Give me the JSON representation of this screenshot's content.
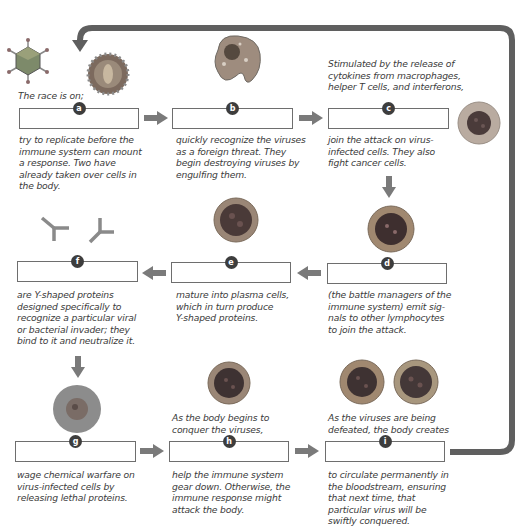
{
  "diagram": {
    "type": "immune-response-flow",
    "colors": {
      "arrow": "#7a7a7a",
      "loop": "#5f5f5f",
      "box_border": "#6e6e6e",
      "badge": "#3d3d3d"
    },
    "steps": [
      {
        "id": "a",
        "badge": "a",
        "text_above": "The race is on;",
        "text_below": "try to replicate before the immune system can mount a response. Two have already taken over cells in the body.",
        "image": "virus-particles"
      },
      {
        "id": "b",
        "badge": "b",
        "text_above": "",
        "text_below": "quickly recognize the viruses as a foreign threat. They begin destroying viruses by engulfing them.",
        "image": "macrophage"
      },
      {
        "id": "c",
        "badge": "c",
        "text_above": "Stimulated by the release of cytokines from macrophages, helper T cells, and interferons,",
        "text_below": "join the attack on virus-infected cells. They also fight cancer cells.",
        "image": "natural-killer-cell"
      },
      {
        "id": "d",
        "badge": "d",
        "text_above": "",
        "text_below": "(the battle managers of the immune system) emit signals to other lymphocytes to join the attack.",
        "image": "helper-t-cell"
      },
      {
        "id": "e",
        "badge": "e",
        "text_above": "",
        "text_below": "mature into plasma cells, which in turn produce Y-shaped proteins.",
        "image": "b-cell"
      },
      {
        "id": "f",
        "badge": "f",
        "text_above": "",
        "text_below": "are Y-shaped proteins designed specifically to recognize a particular viral or bacterial invader; they bind to it and neutralize it.",
        "image": "antibodies"
      },
      {
        "id": "g",
        "badge": "g",
        "text_above": "",
        "text_below": "wage chemical warfare on virus-infected cells by releasing lethal proteins.",
        "image": "killer-t-cell"
      },
      {
        "id": "h",
        "badge": "h",
        "text_above": "As the body begins to conquer the viruses,",
        "text_below": "help the immune system gear down. Otherwise, the immune response might attack the body.",
        "image": "suppressor-t-cell"
      },
      {
        "id": "i",
        "badge": "i",
        "text_above": "As the viruses are being defeated, the body creates",
        "text_below": "to circulate permanently in the bloodstream, ensuring that next time, that particular virus will be swiftly conquered.",
        "image": "memory-cells"
      }
    ],
    "lines": {
      "a_below": [
        "try to replicate before the",
        "immune system can mount",
        "a response. Two have",
        "already taken over cells in",
        "the body."
      ],
      "b_below": [
        "quickly recognize the viruses",
        "as a foreign threat. They",
        "begin destroying viruses by",
        "engulfing them."
      ],
      "c_above": [
        "Stimulated by the release of",
        "cytokines from macrophages,",
        "helper T cells, and interferons,"
      ],
      "c_below": [
        "join the attack on virus-",
        "infected cells. They also",
        "fight cancer cells."
      ],
      "d_below": [
        "(the battle managers of the",
        "immune system) emit sig-",
        "nals to other lymphocytes",
        "to join the attack."
      ],
      "e_below": [
        "mature into plasma cells,",
        "which in turn produce",
        "Y-shaped proteins."
      ],
      "f_below": [
        "are Y-shaped proteins",
        "designed specifically to",
        "recognize a particular viral",
        "or bacterial invader; they",
        "bind to it and neutralize it."
      ],
      "g_below": [
        "wage chemical warfare on",
        "virus-infected cells by",
        "releasing lethal proteins."
      ],
      "h_above": [
        "As the body begins to",
        "conquer the viruses,"
      ],
      "h_below": [
        "help the immune system",
        "gear down. Otherwise, the",
        "immune response might",
        "attack the body."
      ],
      "i_above": [
        "As the viruses are being",
        "defeated, the body creates"
      ],
      "i_below": [
        "to circulate permanently in",
        "the bloodstream, ensuring",
        "that next time, that",
        "particular virus will be",
        "swiftly conquered."
      ]
    }
  }
}
